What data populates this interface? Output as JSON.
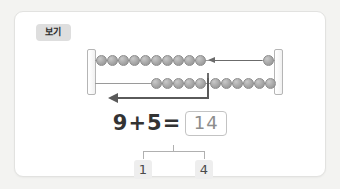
{
  "card": {
    "badge_label": "보기",
    "background_color": "#ffffff",
    "border_color": "#e2e2e0",
    "badge_color": "#dedede"
  },
  "bead_frame": {
    "post_count": 2,
    "rows": [
      {
        "name": "top-row",
        "beads_left_group": 10,
        "beads_right_group": 1,
        "arrow_direction": "left",
        "arrow_style": "thin"
      },
      {
        "name": "bottom-row",
        "beads_left_of_divider": 5,
        "beads_right_of_divider": 9,
        "divider": true,
        "arrow_direction": "left",
        "arrow_style": "thick"
      }
    ],
    "bead_color": "#ababab",
    "wire_color": "#9a9a9a",
    "arrow_color": "#6b6b6b"
  },
  "equation": {
    "addend1": "9",
    "operator": "+",
    "addend2": "5",
    "equals": "=",
    "answer": "14"
  },
  "decomposition": {
    "left_part": "1",
    "right_part": "4"
  }
}
